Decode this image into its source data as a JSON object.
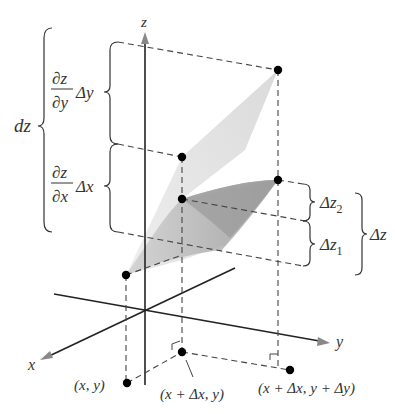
{
  "figure": {
    "type": "3d-total-differential",
    "axes": {
      "z_label": "z",
      "x_label": "x",
      "y_label": "y"
    },
    "left_labels": {
      "dz": "dz",
      "dzdy_num": "∂z",
      "dzdy_den": "∂y",
      "dzdy_factor": "Δy",
      "dzdx_num": "∂z",
      "dzdx_den": "∂x",
      "dzdx_factor": "Δx"
    },
    "right_labels": {
      "dz2_base": "Δz",
      "dz2_sub": "2",
      "dz1_base": "Δz",
      "dz1_sub": "1",
      "dz_total": "Δz"
    },
    "point_labels": {
      "p1": "(x, y)",
      "p2": "(x + Δx, y)",
      "p3": "(x + Δx, y + Δy)"
    },
    "colors": {
      "line": "#222222",
      "dash": "#444444",
      "tangent_plane": "#dcdcdc",
      "surface": "#a8a8a8",
      "text": "#333333"
    }
  }
}
